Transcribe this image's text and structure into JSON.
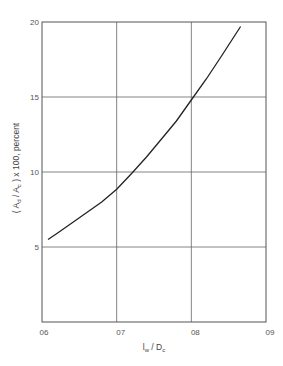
{
  "chart_data": {
    "type": "line",
    "title": "",
    "xlabel": "l_w / D_c",
    "ylabel": "(A_d / A_c) x 100, percent",
    "xlim": [
      0.6,
      0.9
    ],
    "ylim": [
      0,
      20
    ],
    "grid": true,
    "x_ticks": [
      "06",
      "07",
      "08",
      "09"
    ],
    "y_ticks": [
      "5",
      "10",
      "15",
      "20"
    ],
    "series": [
      {
        "name": "curve",
        "x": [
          0.608,
          0.62,
          0.64,
          0.66,
          0.68,
          0.7,
          0.72,
          0.74,
          0.76,
          0.78,
          0.8,
          0.82,
          0.84,
          0.866
        ],
        "y": [
          5.5,
          5.9,
          6.6,
          7.3,
          8.0,
          8.85,
          9.9,
          11.0,
          12.2,
          13.4,
          14.8,
          16.2,
          17.7,
          19.7
        ]
      }
    ]
  },
  "labels": {
    "x_label_main": "l",
    "x_label_sub": "w",
    "x_label_mid": " / D",
    "x_label_sub2": "c",
    "y_label_a": "( A",
    "y_label_a_sub": "d",
    "y_label_b": " / A",
    "y_label_b_sub": "c",
    "y_label_c": " ) x 100,  percent"
  }
}
